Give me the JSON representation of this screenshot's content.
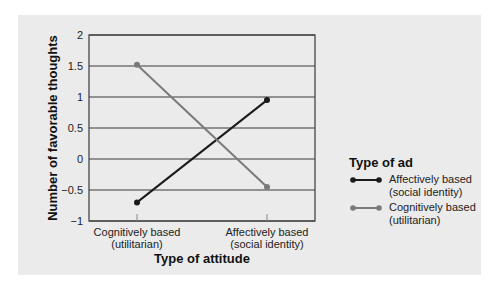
{
  "chart_data": {
    "type": "line",
    "title": "",
    "xlabel": "Type of attitude",
    "ylabel": "Number of favorable thoughts",
    "categories": [
      "Cognitively based (utilitarian)",
      "Affectively based (social identity)"
    ],
    "category_lines": [
      [
        "Cognitively based",
        "(utilitarian)"
      ],
      [
        "Affectively based",
        "(social identity)"
      ]
    ],
    "ylim": [
      -1,
      2
    ],
    "yticks": [
      2,
      1.5,
      1,
      0.5,
      0,
      -0.5,
      -1
    ],
    "ytick_labels": [
      "2",
      "1.5",
      "1",
      "0.5",
      "0",
      "−0.5",
      "−1"
    ],
    "grid": true,
    "legend_position": "right",
    "legend_title": "Type of ad",
    "series": [
      {
        "name": "Affectively based (social identity)",
        "name_lines": [
          "Affectively based",
          "(social identity)"
        ],
        "color": "#1a1a1a",
        "values": [
          -0.7,
          0.95
        ]
      },
      {
        "name": "Cognitively based (utilitarian)",
        "name_lines": [
          "Cognitively based",
          "(utilitarian)"
        ],
        "color": "#7a7a7a",
        "values": [
          1.52,
          -0.45
        ]
      }
    ]
  },
  "colors": {
    "panel_bg": "#ebebeb",
    "gridline": "#3a3a3a"
  }
}
